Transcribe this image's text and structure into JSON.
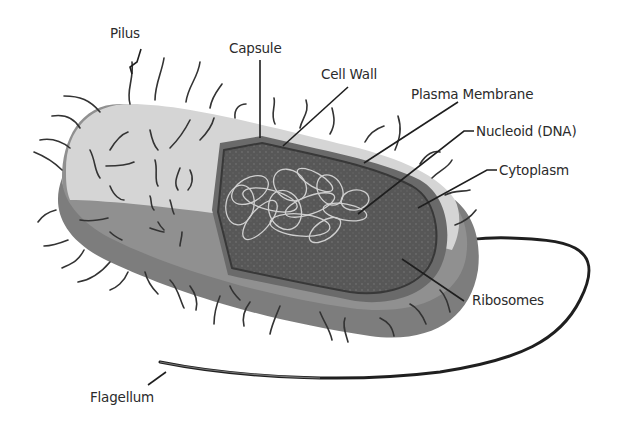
{
  "diagram": {
    "labels": {
      "pilus": "Pilus",
      "capsule": "Capsule",
      "cell_wall": "Cell Wall",
      "plasma_membrane": "Plasma Membrane",
      "nucleoid": "Nucleoid (DNA)",
      "cytoplasm": "Cytoplasm",
      "ribosomes": "Ribosomes",
      "flagellum": "Flagellum"
    },
    "colors": {
      "capsule_top": "#d6d6d6",
      "capsule_side": "#8c8c8c",
      "capsule_bottom": "#7a7a7a",
      "cell_wall": "#6e6e6e",
      "cytoplasm": "#5a5a5a",
      "membrane_edge": "#3a3a3a",
      "dna": "#cfcfcf",
      "pili": "#333333",
      "text": "#2b2b2b"
    }
  }
}
